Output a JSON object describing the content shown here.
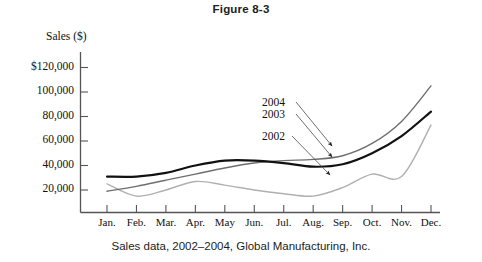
{
  "figure": {
    "title": "Figure 8-3",
    "caption": "Sales data, 2002–2004, Global Manufacturing, Inc."
  },
  "chart_data": {
    "type": "line",
    "title": "Figure 8-3",
    "subtitle": "Sales data, 2002–2004, Global Manufacturing, Inc.",
    "xlabel": "",
    "ylabel": "Sales ($)",
    "ylim": [
      0,
      130000
    ],
    "ytick_values": [
      20000,
      40000,
      60000,
      80000,
      100000,
      120000
    ],
    "ytick_labels": [
      "20,000",
      "40,000",
      "60,000",
      "80,000",
      "100,000",
      "$120,000"
    ],
    "grid": false,
    "legend_position": "inline-annotations",
    "categories": [
      "Jan.",
      "Feb.",
      "Mar.",
      "Apr.",
      "May",
      "Jun.",
      "Jul.",
      "Aug.",
      "Sep.",
      "Oct.",
      "Nov.",
      "Dec."
    ],
    "series": [
      {
        "name": "2004",
        "color": "#6e6e6e",
        "width": 1.4,
        "values": [
          19000,
          23000,
          28000,
          33000,
          38000,
          42000,
          44000,
          45000,
          48000,
          58000,
          76000,
          105000
        ]
      },
      {
        "name": "2003",
        "color": "#111111",
        "width": 2.2,
        "values": [
          31000,
          31000,
          34000,
          40000,
          44000,
          44000,
          42000,
          39000,
          41000,
          50000,
          64000,
          84000
        ]
      },
      {
        "name": "2002",
        "color": "#b0b0b0",
        "width": 1.4,
        "values": [
          25000,
          15000,
          20000,
          27000,
          24000,
          20000,
          17000,
          15000,
          22000,
          33000,
          31000,
          73000
        ]
      }
    ],
    "annotations": [
      {
        "label": "2004",
        "series": "2004"
      },
      {
        "label": "2003",
        "series": "2003"
      },
      {
        "label": "2002",
        "series": "2002"
      }
    ]
  },
  "colors": {
    "axis": "#555555",
    "text": "#111111",
    "series_2004": "#6e6e6e",
    "series_2003": "#111111",
    "series_2002": "#b0b0b0",
    "leader": "#4a4a4a"
  }
}
